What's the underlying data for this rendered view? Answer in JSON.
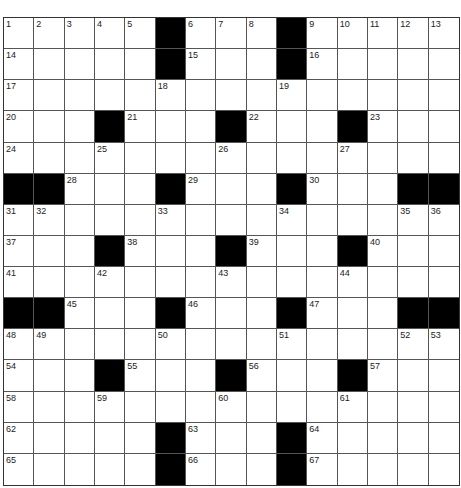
{
  "puzzle": {
    "rows": 15,
    "cols": 15,
    "layout": [
      "....._..._.....",
      "....._..._.....",
      "...............",
      "..._..._..._...",
      "...............",
      "__..._..._...__",
      "...............",
      "..._..._..._...",
      "...............",
      "__..._..._...__",
      "...............",
      "..._..._..._...",
      "...............",
      "....._..._.....",
      "....._..._....."
    ],
    "numbers": [
      {
        "r": 0,
        "c": 0,
        "n": "1"
      },
      {
        "r": 0,
        "c": 1,
        "n": "2"
      },
      {
        "r": 0,
        "c": 2,
        "n": "3"
      },
      {
        "r": 0,
        "c": 3,
        "n": "4"
      },
      {
        "r": 0,
        "c": 4,
        "n": "5"
      },
      {
        "r": 0,
        "c": 6,
        "n": "6"
      },
      {
        "r": 0,
        "c": 7,
        "n": "7"
      },
      {
        "r": 0,
        "c": 8,
        "n": "8"
      },
      {
        "r": 0,
        "c": 10,
        "n": "9"
      },
      {
        "r": 0,
        "c": 11,
        "n": "10"
      },
      {
        "r": 0,
        "c": 12,
        "n": "11"
      },
      {
        "r": 0,
        "c": 13,
        "n": "12"
      },
      {
        "r": 0,
        "c": 14,
        "n": "13"
      },
      {
        "r": 1,
        "c": 0,
        "n": "14"
      },
      {
        "r": 1,
        "c": 6,
        "n": "15"
      },
      {
        "r": 1,
        "c": 10,
        "n": "16"
      },
      {
        "r": 2,
        "c": 0,
        "n": "17"
      },
      {
        "r": 2,
        "c": 5,
        "n": "18"
      },
      {
        "r": 2,
        "c": 9,
        "n": "19"
      },
      {
        "r": 3,
        "c": 0,
        "n": "20"
      },
      {
        "r": 3,
        "c": 4,
        "n": "21"
      },
      {
        "r": 3,
        "c": 8,
        "n": "22"
      },
      {
        "r": 3,
        "c": 12,
        "n": "23"
      },
      {
        "r": 4,
        "c": 0,
        "n": "24"
      },
      {
        "r": 4,
        "c": 3,
        "n": "25"
      },
      {
        "r": 4,
        "c": 7,
        "n": "26"
      },
      {
        "r": 4,
        "c": 11,
        "n": "27"
      },
      {
        "r": 5,
        "c": 2,
        "n": "28"
      },
      {
        "r": 5,
        "c": 6,
        "n": "29"
      },
      {
        "r": 5,
        "c": 10,
        "n": "30"
      },
      {
        "r": 6,
        "c": 0,
        "n": "31"
      },
      {
        "r": 6,
        "c": 1,
        "n": "32"
      },
      {
        "r": 6,
        "c": 5,
        "n": "33"
      },
      {
        "r": 6,
        "c": 9,
        "n": "34"
      },
      {
        "r": 6,
        "c": 13,
        "n": "35"
      },
      {
        "r": 6,
        "c": 14,
        "n": "36"
      },
      {
        "r": 7,
        "c": 0,
        "n": "37"
      },
      {
        "r": 7,
        "c": 4,
        "n": "38"
      },
      {
        "r": 7,
        "c": 8,
        "n": "39"
      },
      {
        "r": 7,
        "c": 12,
        "n": "40"
      },
      {
        "r": 8,
        "c": 0,
        "n": "41"
      },
      {
        "r": 8,
        "c": 3,
        "n": "42"
      },
      {
        "r": 8,
        "c": 7,
        "n": "43"
      },
      {
        "r": 8,
        "c": 11,
        "n": "44"
      },
      {
        "r": 9,
        "c": 2,
        "n": "45"
      },
      {
        "r": 9,
        "c": 6,
        "n": "46"
      },
      {
        "r": 9,
        "c": 10,
        "n": "47"
      },
      {
        "r": 10,
        "c": 0,
        "n": "48"
      },
      {
        "r": 10,
        "c": 1,
        "n": "49"
      },
      {
        "r": 10,
        "c": 5,
        "n": "50"
      },
      {
        "r": 10,
        "c": 9,
        "n": "51"
      },
      {
        "r": 10,
        "c": 13,
        "n": "52"
      },
      {
        "r": 10,
        "c": 14,
        "n": "53"
      },
      {
        "r": 11,
        "c": 0,
        "n": "54"
      },
      {
        "r": 11,
        "c": 4,
        "n": "55"
      },
      {
        "r": 11,
        "c": 8,
        "n": "56"
      },
      {
        "r": 11,
        "c": 12,
        "n": "57"
      },
      {
        "r": 12,
        "c": 0,
        "n": "58"
      },
      {
        "r": 12,
        "c": 3,
        "n": "59"
      },
      {
        "r": 12,
        "c": 7,
        "n": "60"
      },
      {
        "r": 12,
        "c": 11,
        "n": "61"
      },
      {
        "r": 13,
        "c": 0,
        "n": "62"
      },
      {
        "r": 13,
        "c": 6,
        "n": "63"
      },
      {
        "r": 13,
        "c": 10,
        "n": "64"
      },
      {
        "r": 14,
        "c": 0,
        "n": "65"
      },
      {
        "r": 14,
        "c": 6,
        "n": "66"
      },
      {
        "r": 14,
        "c": 10,
        "n": "67"
      }
    ]
  }
}
